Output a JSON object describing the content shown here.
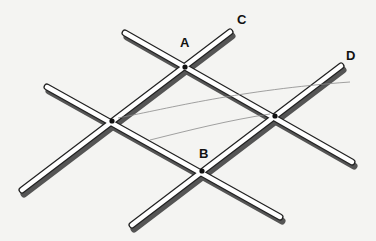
{
  "diagram": {
    "labels": {
      "A": "A",
      "B": "B",
      "C": "C",
      "D": "D"
    },
    "colors": {
      "background": "#f4f4f2",
      "rod_fill": "#ffffff",
      "rod_outline": "#222222",
      "rod_shadow": "#333333",
      "curve": "#888888"
    }
  }
}
